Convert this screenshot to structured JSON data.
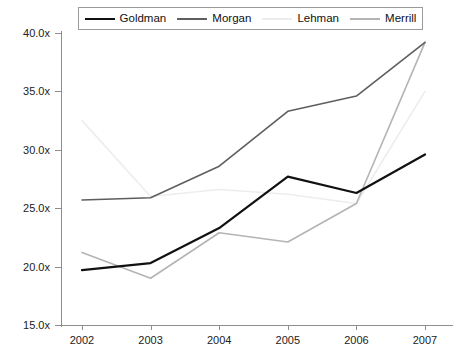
{
  "chart_data": {
    "type": "line",
    "title": "",
    "xlabel": "",
    "ylabel": "",
    "categories": [
      "2002",
      "2003",
      "2004",
      "2005",
      "2006",
      "2007"
    ],
    "ylim": [
      15.0,
      40.0
    ],
    "ytick_step": 5.0,
    "ytick_labels": [
      "40.0x",
      "35.0x",
      "30.0x",
      "25.0x",
      "20.0x",
      "15.0x"
    ],
    "ytick_values": [
      40.0,
      35.0,
      30.0,
      25.0,
      20.0,
      15.0
    ],
    "grid": false,
    "legend_position": "top",
    "series": [
      {
        "name": "Goldman",
        "color": "#111111",
        "width": 2.2,
        "values": [
          19.7,
          20.3,
          23.3,
          27.7,
          26.3,
          29.6
        ]
      },
      {
        "name": "Morgan",
        "color": "#5e5e5e",
        "width": 1.6,
        "values": [
          25.7,
          25.9,
          28.6,
          33.3,
          34.6,
          39.2
        ]
      },
      {
        "name": "Lehman",
        "color": "#ededed",
        "width": 1.6,
        "values": [
          32.5,
          26.0,
          26.6,
          26.2,
          25.4,
          35.0
        ]
      },
      {
        "name": "Merrill",
        "color": "#b4b4b4",
        "width": 1.6,
        "values": [
          21.2,
          19.0,
          22.9,
          22.1,
          25.4,
          39.2
        ]
      }
    ]
  },
  "legend": {
    "items": [
      {
        "label": "Goldman"
      },
      {
        "label": "Morgan"
      },
      {
        "label": "Lehman"
      },
      {
        "label": "Merrill"
      }
    ]
  },
  "axes": {
    "y": {
      "labels": [
        "40.0x",
        "35.0x",
        "30.0x",
        "25.0x",
        "20.0x",
        "15.0x"
      ]
    },
    "x": {
      "labels": [
        "2002",
        "2003",
        "2004",
        "2005",
        "2006",
        "2007"
      ]
    }
  }
}
